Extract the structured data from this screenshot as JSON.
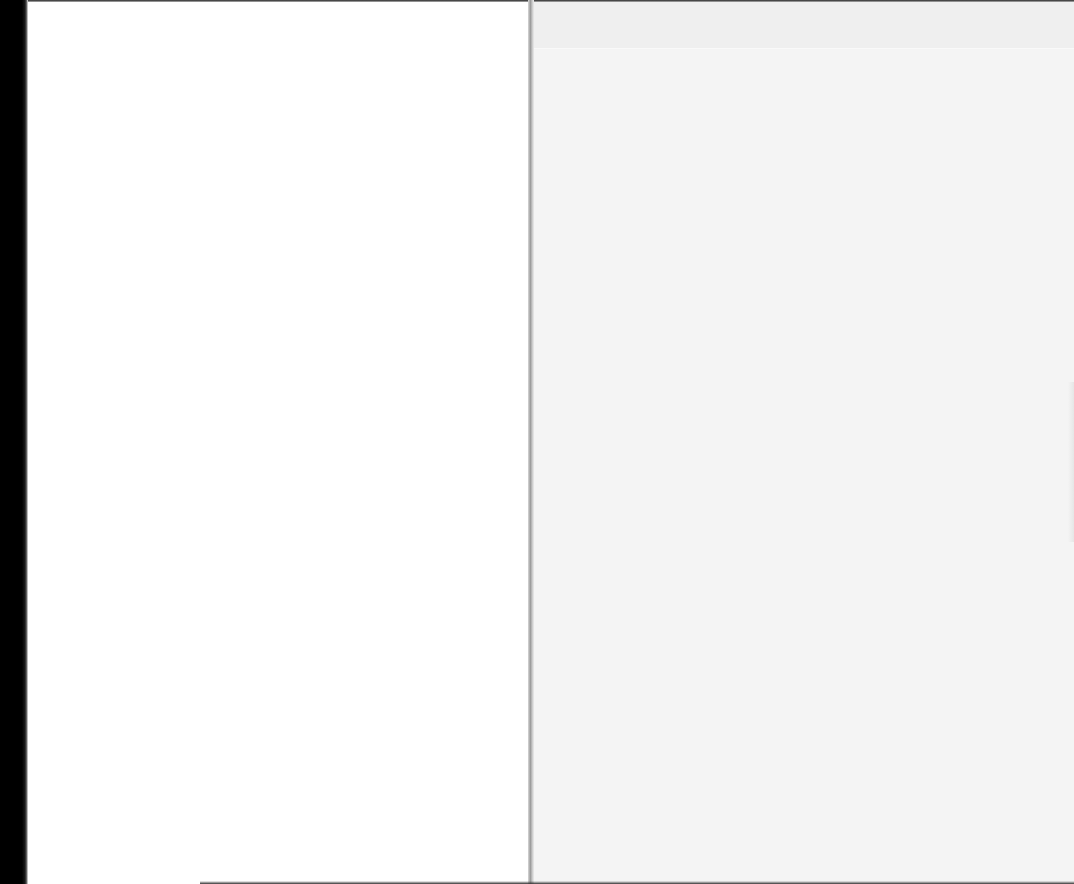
{
  "document": {
    "type": "scanned-book-spread",
    "left_page": {
      "text": ""
    },
    "right_page": {
      "text": ""
    }
  },
  "colors": {
    "binding_edge": "#000000",
    "left_page_bg": "#ffffff",
    "right_page_bg": "#f4f4f4"
  }
}
